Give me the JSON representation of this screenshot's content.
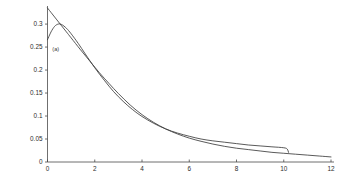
{
  "chart_data": {
    "type": "line",
    "title": "",
    "subtitle": "",
    "xlabel": "",
    "ylabel": "",
    "xlim": [
      0,
      12
    ],
    "ylim": [
      0,
      0.335
    ],
    "grid": false,
    "legend_position": "none",
    "x_ticks": [
      "0",
      "2",
      "4",
      "6",
      "8",
      "10",
      "12"
    ],
    "x_tick_values": [
      0,
      2,
      4,
      6,
      8,
      10,
      12
    ],
    "y_ticks": [
      "0",
      "0.05",
      "0.1",
      "0.15",
      "0.2",
      "0.25",
      "0.3"
    ],
    "y_tick_values": [
      0,
      0.05,
      0.1,
      0.15,
      0.2,
      0.25,
      0.3
    ],
    "annotations": [
      {
        "text": "(a)",
        "x": 0.35,
        "y": 0.242
      }
    ],
    "series": [
      {
        "name": "curve-1",
        "color": "#3c3c3c",
        "x": [
          0,
          0.2,
          0.4,
          0.6,
          0.8,
          1.0,
          1.4,
          1.8,
          2.2,
          2.6,
          3.0,
          3.5,
          4.0,
          4.5,
          5.0,
          5.5,
          6.0,
          6.5,
          7.0,
          7.5,
          8.0,
          8.5,
          9.0,
          9.5,
          10.0,
          10.5,
          11.0,
          11.5,
          12.0
        ],
        "y": [
          0.335,
          0.322,
          0.309,
          0.296,
          0.283,
          0.27,
          0.244,
          0.219,
          0.194,
          0.171,
          0.149,
          0.124,
          0.103,
          0.086,
          0.072,
          0.061,
          0.052,
          0.045,
          0.039,
          0.034,
          0.03,
          0.027,
          0.024,
          0.021,
          0.019,
          0.017,
          0.015,
          0.013,
          0.011
        ]
      },
      {
        "name": "curve-2",
        "color": "#3c3c3c",
        "x": [
          0,
          0.15,
          0.3,
          0.45,
          0.6,
          0.8,
          1.0,
          1.3,
          1.6,
          2.0,
          2.4,
          2.8,
          3.2,
          3.6,
          4.0,
          4.5,
          5.0,
          5.5,
          6.0,
          6.5,
          7.0,
          7.5,
          8.0,
          8.5,
          9.0,
          9.5,
          10.0,
          10.15,
          10.2
        ],
        "y": [
          0.266,
          0.283,
          0.295,
          0.3,
          0.299,
          0.291,
          0.279,
          0.258,
          0.235,
          0.205,
          0.178,
          0.153,
          0.132,
          0.114,
          0.099,
          0.084,
          0.072,
          0.063,
          0.056,
          0.05,
          0.046,
          0.043,
          0.04,
          0.037,
          0.035,
          0.033,
          0.031,
          0.028,
          0.021
        ]
      }
    ]
  }
}
